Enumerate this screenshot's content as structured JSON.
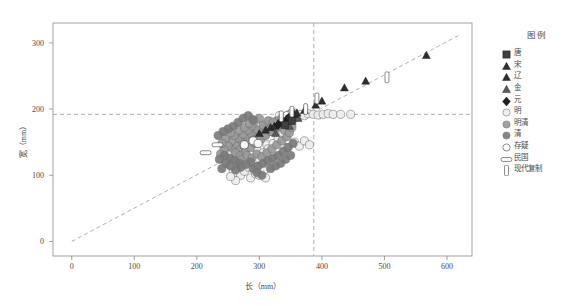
{
  "figure": {
    "title": "",
    "x_axis": {
      "label": "长（mm）",
      "ticks": [
        0,
        100,
        200,
        300,
        400,
        500,
        600
      ],
      "min": -30,
      "max": 640
    },
    "y_axis": {
      "label": "宽（mm）",
      "ticks": [
        0,
        100,
        200,
        300
      ],
      "min": -22,
      "max": 330
    }
  },
  "legend": {
    "title": "图例",
    "items": [
      {
        "label": "唐",
        "marker": "square",
        "color": "#3f3f3f"
      },
      {
        "label": "宋",
        "marker": "triangle",
        "color": "#2e2e2e"
      },
      {
        "label": "辽",
        "marker": "triangle",
        "color": "#2e2e2e"
      },
      {
        "label": "金",
        "marker": "triangle",
        "color": "#5a5a5a"
      },
      {
        "label": "元",
        "marker": "diamond",
        "color": "#1f1f1f"
      },
      {
        "label": "明",
        "marker": "circle",
        "color": "#ededed"
      },
      {
        "label": "明清",
        "marker": "circle",
        "color": "#9a9a9a"
      },
      {
        "label": "清",
        "marker": "circle",
        "color": "#7b7b7b"
      },
      {
        "label": "存疑",
        "marker": "open-circle",
        "color": "#ffffff"
      },
      {
        "label": "民国",
        "marker": "h-rect",
        "color": "#ffffff"
      },
      {
        "label": "现代复制",
        "marker": "v-rect",
        "color": "#ffffff"
      }
    ]
  },
  "reference_lines": {
    "horizontal_y": 192,
    "vertical_x": 387,
    "style": "dashed",
    "color": "#9a9a9a",
    "trend": {
      "from": [
        0,
        0
      ],
      "to": [
        620,
        312
      ],
      "style": "dashed",
      "color": "#9a9a9a"
    }
  },
  "chart_data": {
    "type": "scatter",
    "title": "",
    "xlabel": "长（mm）",
    "ylabel": "宽（mm）",
    "xlim": [
      -30,
      640
    ],
    "ylim": [
      -22,
      330
    ],
    "grid": false,
    "legend_position": "right",
    "annotations": [
      {
        "text": "水平参考线 宽=192mm",
        "y": 192
      },
      {
        "text": "垂直参考线 长=387mm",
        "x": 387
      }
    ],
    "series": [
      {
        "name": "唐",
        "marker": "square",
        "color": "#3f3f3f",
        "points": [
          [
            352,
            182
          ],
          [
            341,
            176
          ]
        ]
      },
      {
        "name": "宋",
        "marker": "triangle",
        "color": "#2e2e2e",
        "points": [
          [
            300,
            163
          ],
          [
            318,
            172
          ],
          [
            330,
            178
          ],
          [
            337,
            182
          ],
          [
            345,
            186
          ],
          [
            352,
            190
          ],
          [
            360,
            194
          ],
          [
            372,
            198
          ],
          [
            390,
            206
          ],
          [
            400,
            212
          ],
          [
            436,
            232
          ],
          [
            470,
            242
          ],
          [
            567,
            281
          ],
          [
            324,
            174
          ],
          [
            310,
            168
          ],
          [
            347,
            188
          ]
        ]
      },
      {
        "name": "辽",
        "marker": "triangle",
        "color": "#2e2e2e",
        "points": [
          [
            334,
            180
          ],
          [
            343,
            185
          ],
          [
            356,
            192
          ]
        ]
      },
      {
        "name": "金",
        "marker": "triangle",
        "color": "#5a5a5a",
        "points": [
          [
            326,
            163
          ],
          [
            348,
            174
          ],
          [
            362,
            186
          ]
        ]
      },
      {
        "name": "元",
        "marker": "diamond",
        "color": "#1f1f1f",
        "points": [
          [
            330,
            176
          ],
          [
            340,
            181
          ]
        ]
      },
      {
        "name": "明",
        "marker": "circle",
        "color": "#ededed",
        "points": [
          [
            248,
            150
          ],
          [
            252,
            132
          ],
          [
            256,
            124
          ],
          [
            262,
            118
          ],
          [
            268,
            128
          ],
          [
            272,
            140
          ],
          [
            276,
            112
          ],
          [
            280,
            150
          ],
          [
            284,
            158
          ],
          [
            288,
            122
          ],
          [
            292,
            166
          ],
          [
            296,
            138
          ],
          [
            300,
            176
          ],
          [
            304,
            120
          ],
          [
            308,
            160
          ],
          [
            312,
            146
          ],
          [
            316,
            182
          ],
          [
            320,
            128
          ],
          [
            324,
            170
          ],
          [
            328,
            150
          ],
          [
            332,
            190
          ],
          [
            336,
            162
          ],
          [
            340,
            186
          ],
          [
            344,
            142
          ],
          [
            348,
            192
          ],
          [
            352,
            178
          ],
          [
            356,
            194
          ],
          [
            360,
            188
          ],
          [
            366,
            192
          ],
          [
            372,
            190
          ],
          [
            378,
            193
          ],
          [
            386,
            192
          ],
          [
            394,
            191
          ],
          [
            402,
            192
          ],
          [
            410,
            193
          ],
          [
            418,
            192
          ],
          [
            430,
            192
          ],
          [
            446,
            192
          ],
          [
            258,
            108
          ],
          [
            264,
            104
          ],
          [
            270,
            100
          ],
          [
            276,
            106
          ],
          [
            283,
            112
          ],
          [
            290,
            118
          ],
          [
            297,
            125
          ],
          [
            306,
            134
          ],
          [
            314,
            140
          ],
          [
            322,
            148
          ],
          [
            330,
            156
          ],
          [
            338,
            164
          ],
          [
            346,
            170
          ],
          [
            300,
            110
          ],
          [
            308,
            108
          ],
          [
            316,
            116
          ],
          [
            286,
            96
          ],
          [
            294,
            102
          ],
          [
            252,
            116
          ],
          [
            246,
            124
          ],
          [
            242,
            136
          ],
          [
            356,
            150
          ],
          [
            364,
            144
          ],
          [
            372,
            152
          ],
          [
            380,
            146
          ],
          [
            300,
            100
          ],
          [
            310,
            96
          ],
          [
            262,
            92
          ],
          [
            254,
            98
          ]
        ]
      },
      {
        "name": "明清",
        "marker": "circle",
        "color": "#9a9a9a",
        "points": [
          [
            258,
            140
          ],
          [
            264,
            146
          ],
          [
            268,
            138
          ],
          [
            272,
            152
          ],
          [
            276,
            144
          ],
          [
            280,
            158
          ],
          [
            284,
            150
          ],
          [
            288,
            162
          ],
          [
            292,
            154
          ],
          [
            296,
            166
          ],
          [
            300,
            158
          ],
          [
            304,
            170
          ],
          [
            308,
            162
          ],
          [
            312,
            174
          ],
          [
            316,
            166
          ],
          [
            320,
            178
          ],
          [
            324,
            170
          ],
          [
            328,
            182
          ],
          [
            332,
            174
          ],
          [
            336,
            186
          ],
          [
            262,
            134
          ],
          [
            270,
            130
          ],
          [
            278,
            136
          ],
          [
            286,
            142
          ],
          [
            294,
            148
          ],
          [
            302,
            154
          ],
          [
            310,
            160
          ],
          [
            318,
            166
          ],
          [
            326,
            172
          ],
          [
            334,
            178
          ],
          [
            266,
            156
          ],
          [
            274,
            162
          ],
          [
            282,
            168
          ],
          [
            290,
            174
          ],
          [
            298,
            168
          ],
          [
            306,
            176
          ],
          [
            314,
            182
          ],
          [
            322,
            180
          ],
          [
            256,
            152
          ],
          [
            260,
            160
          ],
          [
            268,
            168
          ],
          [
            276,
            172
          ],
          [
            284,
            178
          ],
          [
            292,
            182
          ],
          [
            300,
            186
          ],
          [
            250,
            144
          ],
          [
            244,
            138
          ],
          [
            238,
            132
          ],
          [
            246,
            156
          ],
          [
            254,
            164
          ],
          [
            240,
            148
          ],
          [
            272,
            124
          ],
          [
            280,
            130
          ],
          [
            288,
            126
          ],
          [
            296,
            132
          ],
          [
            304,
            128
          ],
          [
            312,
            134
          ],
          [
            320,
            140
          ],
          [
            328,
            146
          ],
          [
            336,
            152
          ],
          [
            344,
            158
          ],
          [
            340,
            168
          ],
          [
            348,
            164
          ],
          [
            352,
            172
          ],
          [
            344,
            176
          ]
        ]
      },
      {
        "name": "清",
        "marker": "circle",
        "color": "#7b7b7b",
        "points": [
          [
            252,
            126
          ],
          [
            260,
            122
          ],
          [
            268,
            118
          ],
          [
            244,
            130
          ],
          [
            236,
            124
          ],
          [
            290,
            110
          ],
          [
            298,
            114
          ],
          [
            306,
            118
          ],
          [
            314,
            122
          ],
          [
            322,
            126
          ],
          [
            330,
            130
          ],
          [
            338,
            136
          ],
          [
            346,
            142
          ],
          [
            354,
            148
          ],
          [
            286,
            120
          ],
          [
            278,
            116
          ],
          [
            270,
            112
          ],
          [
            262,
            108
          ],
          [
            318,
            110
          ],
          [
            326,
            114
          ],
          [
            334,
            118
          ],
          [
            342,
            124
          ],
          [
            350,
            130
          ],
          [
            246,
            118
          ],
          [
            254,
            114
          ],
          [
            240,
            110
          ],
          [
            296,
            104
          ],
          [
            304,
            100
          ],
          [
            258,
            174
          ],
          [
            266,
            180
          ],
          [
            274,
            186
          ],
          [
            282,
            190
          ],
          [
            290,
            184
          ],
          [
            250,
            170
          ],
          [
            242,
            166
          ],
          [
            234,
            160
          ]
        ]
      },
      {
        "name": "存疑",
        "marker": "open-circle",
        "color": "#ffffff",
        "points": [
          [
            290,
            152
          ],
          [
            298,
            148
          ],
          [
            352,
            194
          ],
          [
            344,
            190
          ],
          [
            276,
            146
          ]
        ]
      },
      {
        "name": "民国",
        "marker": "h-rect",
        "color": "#ffffff",
        "points": [
          [
            233,
            146
          ],
          [
            214,
            134
          ]
        ]
      },
      {
        "name": "现代复制",
        "marker": "v-rect",
        "color": "#ffffff",
        "points": [
          [
            335,
            189
          ],
          [
            352,
            196
          ],
          [
            392,
            216
          ],
          [
            504,
            248
          ],
          [
            374,
            200
          ]
        ]
      }
    ]
  },
  "bottom_caption": ""
}
